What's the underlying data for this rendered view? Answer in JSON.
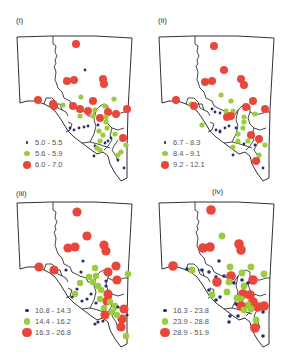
{
  "colors": {
    "low": "#22306e",
    "mid": "#9acd3c",
    "high": "#e8473a",
    "outline": "#1a1a1a"
  },
  "chart_data": [
    {
      "type": "scatter",
      "title": "(i)",
      "legend": [
        {
          "range": "5.0 - 5.5",
          "class": "low"
        },
        {
          "range": "5.6 - 5.9",
          "class": "mid"
        },
        {
          "range": "6.0 - 7.0",
          "class": "high"
        }
      ]
    },
    {
      "type": "scatter",
      "title": "(ii)",
      "legend": [
        {
          "range": "6.7 - 8.3",
          "class": "low"
        },
        {
          "range": "8.4 - 9.1",
          "class": "mid"
        },
        {
          "range": "9.2 - 12.1",
          "class": "high"
        }
      ]
    },
    {
      "type": "scatter",
      "title": "(iii)",
      "legend": [
        {
          "range": "10.8 - 14.3",
          "class": "low"
        },
        {
          "range": "14.4 - 16.2",
          "class": "mid"
        },
        {
          "range": "16.3 - 26.8",
          "class": "high"
        }
      ]
    },
    {
      "type": "scatter",
      "title": "(iv)",
      "legend": [
        {
          "range": "16.3 - 23.8",
          "class": "low"
        },
        {
          "range": "23.9 - 28.8",
          "class": "mid"
        },
        {
          "range": "28.9 - 51.9",
          "class": "high"
        }
      ]
    }
  ],
  "panels": [
    {
      "label": "(i)",
      "label_pos": [
        16,
        23
      ],
      "origin": [
        0,
        0
      ],
      "legend_pos": [
        22,
        141
      ],
      "sizes": {
        "low": 1.4,
        "mid": 2.6,
        "high": 4.0
      },
      "points": [
        [
          76,
          44,
          "high"
        ],
        [
          85,
          70,
          "low"
        ],
        [
          67,
          81,
          "high"
        ],
        [
          74,
          80,
          "high"
        ],
        [
          103,
          79,
          "high"
        ],
        [
          104,
          84,
          "high"
        ],
        [
          38,
          100,
          "high"
        ],
        [
          53,
          104,
          "high"
        ],
        [
          54,
          106,
          "high"
        ],
        [
          63,
          105,
          "mid"
        ],
        [
          73,
          106,
          "high"
        ],
        [
          80,
          109,
          "high"
        ],
        [
          81,
          97,
          "mid"
        ],
        [
          93,
          101,
          "high"
        ],
        [
          114,
          99,
          "mid"
        ],
        [
          105,
          106,
          "mid"
        ],
        [
          88,
          111,
          "high"
        ],
        [
          95,
          110,
          "mid"
        ],
        [
          108,
          112,
          "high"
        ],
        [
          116,
          114,
          "high"
        ],
        [
          127,
          109,
          "high"
        ],
        [
          80,
          116,
          "mid"
        ],
        [
          93,
          116,
          "mid"
        ],
        [
          100,
          118,
          "high"
        ],
        [
          106,
          117,
          "mid"
        ],
        [
          106,
          122,
          "mid"
        ],
        [
          107,
          128,
          "mid"
        ],
        [
          98,
          125,
          "low"
        ],
        [
          70,
          128,
          "low"
        ],
        [
          74,
          130,
          "low"
        ],
        [
          79,
          128,
          "low"
        ],
        [
          84,
          127,
          "low"
        ],
        [
          88,
          126,
          "low"
        ],
        [
          99,
          131,
          "mid"
        ],
        [
          103,
          135,
          "mid"
        ],
        [
          100,
          141,
          "mid"
        ],
        [
          105,
          143,
          "low"
        ],
        [
          108,
          141,
          "low"
        ],
        [
          111,
          138,
          "low"
        ],
        [
          115,
          134,
          "mid"
        ],
        [
          123,
          138,
          "high"
        ],
        [
          126,
          145,
          "mid"
        ],
        [
          95,
          146,
          "low"
        ],
        [
          100,
          150,
          "mid"
        ],
        [
          94,
          156,
          "low"
        ],
        [
          121,
          152,
          "mid"
        ],
        [
          118,
          155,
          "mid"
        ],
        [
          118,
          160,
          "low"
        ],
        [
          124,
          168,
          "low"
        ],
        [
          97,
          148,
          "mid"
        ]
      ]
    },
    {
      "label": "(ii)",
      "label_pos": [
        158,
        23
      ],
      "origin": [
        142,
        0
      ],
      "legend_pos": [
        160,
        141
      ],
      "sizes": {
        "low": 1.4,
        "mid": 2.6,
        "high": 4.0
      },
      "points": [
        [
          72,
          46,
          "high"
        ],
        [
          82,
          70,
          "high"
        ],
        [
          63,
          82,
          "high"
        ],
        [
          70,
          81,
          "high"
        ],
        [
          99,
          79,
          "high"
        ],
        [
          102,
          85,
          "high"
        ],
        [
          34,
          100,
          "high"
        ],
        [
          49,
          104,
          "mid"
        ],
        [
          52,
          106,
          "high"
        ],
        [
          79,
          95,
          "mid"
        ],
        [
          111,
          101,
          "high"
        ],
        [
          89,
          101,
          "mid"
        ],
        [
          104,
          107,
          "high"
        ],
        [
          123,
          109,
          "high"
        ],
        [
          84,
          111,
          "mid"
        ],
        [
          91,
          111,
          "mid"
        ],
        [
          85,
          117,
          "high"
        ],
        [
          89,
          116,
          "high"
        ],
        [
          102,
          117,
          "mid"
        ],
        [
          113,
          114,
          "mid"
        ],
        [
          102,
          122,
          "mid"
        ],
        [
          101,
          128,
          "mid"
        ],
        [
          70,
          109,
          "low"
        ],
        [
          73,
          112,
          "low"
        ],
        [
          78,
          113,
          "low"
        ],
        [
          60,
          125,
          "mid"
        ],
        [
          74,
          130,
          "low"
        ],
        [
          78,
          131,
          "low"
        ],
        [
          83,
          128,
          "low"
        ],
        [
          87,
          126,
          "low"
        ],
        [
          78,
          132,
          "low"
        ],
        [
          94,
          128,
          "low"
        ],
        [
          96,
          134,
          "mid"
        ],
        [
          109,
          135,
          "high"
        ],
        [
          106,
          141,
          "mid"
        ],
        [
          117,
          139,
          "high"
        ],
        [
          123,
          145,
          "mid"
        ],
        [
          102,
          144,
          "low"
        ],
        [
          113,
          145,
          "low"
        ],
        [
          117,
          155,
          "mid"
        ],
        [
          114,
          161,
          "high"
        ],
        [
          91,
          147,
          "mid"
        ],
        [
          91,
          155,
          "low"
        ],
        [
          121,
          168,
          "low"
        ],
        [
          96,
          141,
          "mid"
        ]
      ]
    },
    {
      "label": "(iii)",
      "label_pos": [
        16,
        196
      ],
      "origin": [
        0,
        182
      ],
      "legend_pos": [
        22,
        309
      ],
      "sizes": {
        "low": 1.6,
        "mid": 3.2,
        "high": 4.6
      },
      "points": [
        [
          77,
          30,
          "high"
        ],
        [
          87,
          54,
          "high"
        ],
        [
          68,
          66,
          "high"
        ],
        [
          75,
          65,
          "high"
        ],
        [
          104,
          63,
          "high"
        ],
        [
          106,
          69,
          "high"
        ],
        [
          83,
          79,
          "low"
        ],
        [
          39,
          85,
          "high"
        ],
        [
          54,
          88,
          "high"
        ],
        [
          66,
          88,
          "low"
        ],
        [
          81,
          90,
          "low"
        ],
        [
          95,
          86,
          "mid"
        ],
        [
          116,
          84,
          "high"
        ],
        [
          108,
          90,
          "high"
        ],
        [
          128,
          92,
          "mid"
        ],
        [
          89,
          95,
          "mid"
        ],
        [
          96,
          94,
          "mid"
        ],
        [
          93,
          100,
          "mid"
        ],
        [
          80,
          101,
          "mid"
        ],
        [
          98,
          104,
          "mid"
        ],
        [
          106,
          99,
          "low"
        ],
        [
          117,
          98,
          "high"
        ],
        [
          106,
          104,
          "low"
        ],
        [
          101,
          108,
          "mid"
        ],
        [
          77,
          107,
          "low"
        ],
        [
          75,
          112,
          "mid"
        ],
        [
          72,
          115,
          "low"
        ],
        [
          91,
          112,
          "low"
        ],
        [
          87,
          117,
          "low"
        ],
        [
          82,
          119,
          "low"
        ],
        [
          108,
          112,
          "high"
        ],
        [
          107,
          119,
          "high"
        ],
        [
          100,
          117,
          "mid"
        ],
        [
          104,
          126,
          "mid"
        ],
        [
          110,
          120,
          "mid"
        ],
        [
          115,
          124,
          "mid"
        ],
        [
          118,
          125,
          "low"
        ],
        [
          96,
          121,
          "low"
        ],
        [
          105,
          133,
          "high"
        ],
        [
          112,
          130,
          "mid"
        ],
        [
          124,
          127,
          "high"
        ],
        [
          127,
          133,
          "low"
        ],
        [
          95,
          142,
          "low"
        ],
        [
          98,
          140,
          "low"
        ],
        [
          103,
          139,
          "low"
        ],
        [
          122,
          137,
          "high"
        ],
        [
          121,
          145,
          "high"
        ],
        [
          126,
          154,
          "mid"
        ],
        [
          117,
          133,
          "mid"
        ]
      ]
    },
    {
      "label": "(iv)",
      "label_pos": [
        212,
        194
      ],
      "origin": [
        142,
        182
      ],
      "legend_pos": [
        160,
        309
      ],
      "sizes": {
        "low": 1.8,
        "mid": 3.4,
        "high": 4.8
      },
      "points": [
        [
          69,
          28,
          "high"
        ],
        [
          80,
          54,
          "mid"
        ],
        [
          61,
          66,
          "high"
        ],
        [
          68,
          65,
          "high"
        ],
        [
          97,
          62,
          "high"
        ],
        [
          99,
          68,
          "high"
        ],
        [
          77,
          79,
          "low"
        ],
        [
          31,
          84,
          "high"
        ],
        [
          45,
          87,
          "low"
        ],
        [
          50,
          88,
          "mid"
        ],
        [
          60,
          88,
          "low"
        ],
        [
          67,
          90,
          "low"
        ],
        [
          88,
          85,
          "mid"
        ],
        [
          89,
          94,
          "high"
        ],
        [
          100,
          91,
          "mid"
        ],
        [
          109,
          85,
          "mid"
        ],
        [
          122,
          92,
          "mid"
        ],
        [
          74,
          95,
          "low"
        ],
        [
          82,
          94,
          "low"
        ],
        [
          87,
          100,
          "mid"
        ],
        [
          75,
          100,
          "high"
        ],
        [
          92,
          101,
          "low"
        ],
        [
          100,
          98,
          "low"
        ],
        [
          111,
          98,
          "high"
        ],
        [
          102,
          104,
          "mid"
        ],
        [
          106,
          101,
          "low"
        ],
        [
          101,
          112,
          "high"
        ],
        [
          99,
          117,
          "mid"
        ],
        [
          95,
          116,
          "mid"
        ],
        [
          85,
          110,
          "mid"
        ],
        [
          70,
          113,
          "mid"
        ],
        [
          67,
          108,
          "low"
        ],
        [
          78,
          115,
          "low"
        ],
        [
          74,
          118,
          "low"
        ],
        [
          108,
          113,
          "high"
        ],
        [
          111,
          120,
          "high"
        ],
        [
          106,
          123,
          "mid"
        ],
        [
          116,
          125,
          "high"
        ],
        [
          122,
          124,
          "high"
        ],
        [
          99,
          124,
          "high"
        ],
        [
          102,
          128,
          "mid"
        ],
        [
          109,
          127,
          "mid"
        ],
        [
          94,
          122,
          "low"
        ],
        [
          88,
          134,
          "low"
        ],
        [
          96,
          134,
          "low"
        ],
        [
          114,
          138,
          "mid"
        ],
        [
          113,
          146,
          "high"
        ],
        [
          121,
          154,
          "low"
        ],
        [
          87,
          140,
          "low"
        ],
        [
          121,
          130,
          "low"
        ]
      ]
    }
  ]
}
